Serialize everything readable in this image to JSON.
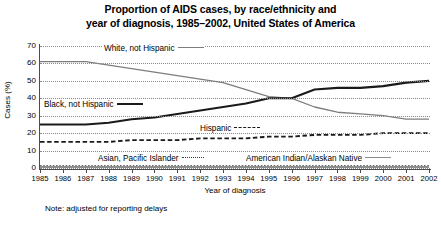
{
  "title": {
    "line1": "Proportion of AIDS cases, by race/ethnicity and",
    "line2": "year of diagnosis, 1985–2002, United States of America"
  },
  "note": "Note: adjusted for reporting delays",
  "legend": {
    "white": "White, not Hispanic",
    "black": "Black, not Hispanic",
    "hispanic": "Hispanic",
    "asian": "Asian, Pacific Islander",
    "native": "American Indian/Alaskan Native"
  },
  "colors": {
    "white_line": "#7d7d7d",
    "black_line": "#1a1a1a",
    "hispanic_line": "#1a1a1a",
    "asian_line": "#3a3a3a",
    "native_line": "#8d8d8d",
    "grid": "#8a8a8a",
    "axis": "#4c4c4c",
    "background": "#ffffff"
  },
  "chart_data": {
    "type": "line",
    "title": "Proportion of AIDS cases, by race/ethnicity and year of diagnosis, 1985–2002, United States of America",
    "xlabel": "Year of diagnosis",
    "ylabel": "Cases (%)",
    "xlim": [
      1985,
      2002
    ],
    "ylim": [
      0,
      70
    ],
    "yticks": [
      0,
      10,
      20,
      30,
      40,
      50,
      60,
      70
    ],
    "grid": true,
    "legend_position": "in-plot annotations",
    "categories": [
      1985,
      1986,
      1987,
      1988,
      1989,
      1990,
      1991,
      1992,
      1993,
      1994,
      1995,
      1996,
      1997,
      1998,
      1999,
      2000,
      2001,
      2002
    ],
    "series": [
      {
        "name": "White, not Hispanic",
        "style": "solid",
        "color": "#7d7d7d",
        "values": [
          61,
          61,
          61,
          59,
          57,
          55,
          53,
          51,
          49,
          45,
          41,
          40,
          35,
          32,
          31,
          30,
          28,
          28
        ]
      },
      {
        "name": "Black, not Hispanic",
        "style": "solid",
        "color": "#1a1a1a",
        "values": [
          25,
          25,
          25,
          26,
          28,
          29,
          31,
          33,
          35,
          37,
          40,
          40,
          45,
          46,
          46,
          47,
          49,
          50
        ]
      },
      {
        "name": "Hispanic",
        "style": "dashed",
        "color": "#1a1a1a",
        "values": [
          15,
          15,
          15,
          15,
          16,
          16,
          16,
          17,
          17,
          17,
          18,
          18,
          19,
          19,
          19,
          20,
          20,
          20
        ]
      },
      {
        "name": "Asian, Pacific Islander",
        "style": "dotted",
        "color": "#3a3a3a",
        "values": [
          1,
          1,
          1,
          1,
          1,
          1,
          1,
          1,
          1,
          1,
          1,
          1,
          1,
          1,
          1,
          1,
          1,
          1
        ]
      },
      {
        "name": "American Indian/Alaskan Native",
        "style": "solid",
        "color": "#8d8d8d",
        "values": [
          0.4,
          0.4,
          0.4,
          0.4,
          0.4,
          0.4,
          0.4,
          0.4,
          0.4,
          0.4,
          0.4,
          0.4,
          0.4,
          0.4,
          0.4,
          0.4,
          0.4,
          0.4
        ]
      }
    ]
  }
}
